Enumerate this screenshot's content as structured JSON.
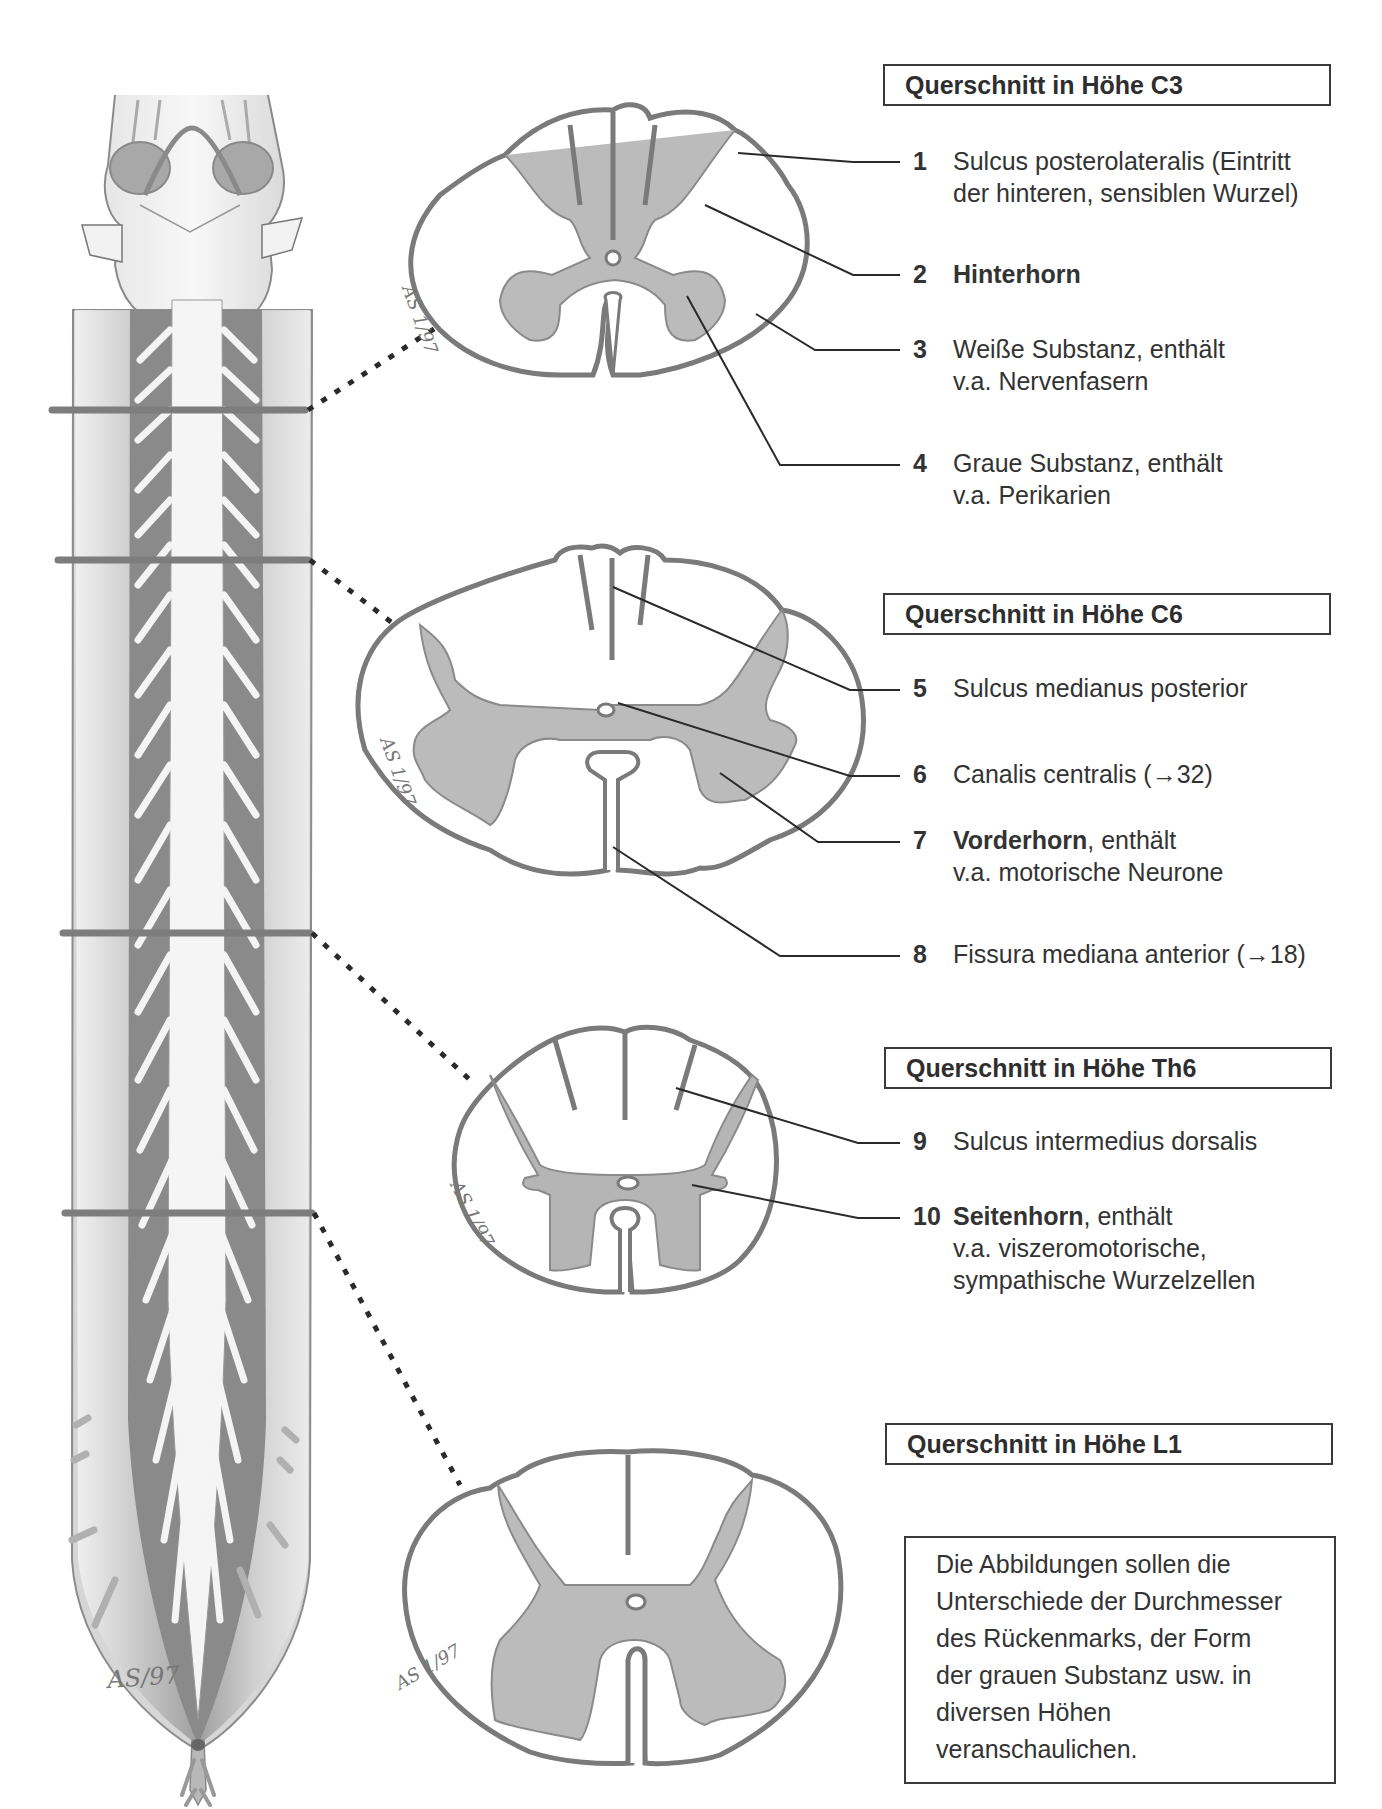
{
  "sections": [
    {
      "id": "c3",
      "title": "Querschnitt in Höhe C3"
    },
    {
      "id": "c6",
      "title": "Querschnitt in Höhe C6"
    },
    {
      "id": "th6",
      "title": "Querschnitt in Höhe Th6"
    },
    {
      "id": "l1",
      "title": "Querschnitt in Höhe L1"
    }
  ],
  "labels": [
    {
      "num": "1",
      "bold": "",
      "text": "Sulcus posterolateralis (Eintritt",
      "line2": "der hinteren, sensiblen Wurzel)"
    },
    {
      "num": "2",
      "bold": "Hinterhorn",
      "text": "",
      "line2": ""
    },
    {
      "num": "3",
      "bold": "",
      "text": "Weiße Substanz, enthält",
      "line2": "v.a. Nervenfasern"
    },
    {
      "num": "4",
      "bold": "",
      "text": "Graue Substanz, enthält",
      "line2": "v.a. Perikarien"
    },
    {
      "num": "5",
      "bold": "",
      "text": "Sulcus medianus posterior",
      "line2": ""
    },
    {
      "num": "6",
      "bold": "",
      "text": "Canalis centralis (→32)",
      "line2": ""
    },
    {
      "num": "7",
      "bold": "Vorderhorn",
      "text": ", enthält",
      "line2": "v.a. motorische Neurone"
    },
    {
      "num": "8",
      "bold": "",
      "text": "Fissura mediana anterior (→18)",
      "line2": ""
    },
    {
      "num": "9",
      "bold": "",
      "text": "Sulcus intermedius dorsalis",
      "line2": ""
    },
    {
      "num": "10",
      "bold": "Seitenhorn",
      "text": ", enthält",
      "line2": "v.a. viszeromotorische,",
      "line3": "sympathische Wurzelzellen"
    }
  ],
  "note": {
    "lines": [
      "Die Abbildungen sollen die",
      "Unterschiede der Durchmesser",
      "des Rückenmarks, der Form",
      "der grauen Substanz usw. in",
      "diversen Höhen",
      "veranschaulichen."
    ]
  },
  "signatures": {
    "main": "AS/97",
    "c3": "AS 1/97",
    "c6": "AS 1/97",
    "th6": "AS 1/97",
    "l1": "AS 1/97"
  },
  "colors": {
    "outline": "#7a7a7a",
    "grey_matter": "#b9b9b9",
    "text": "#333333",
    "leader": "#2a2a2a"
  }
}
